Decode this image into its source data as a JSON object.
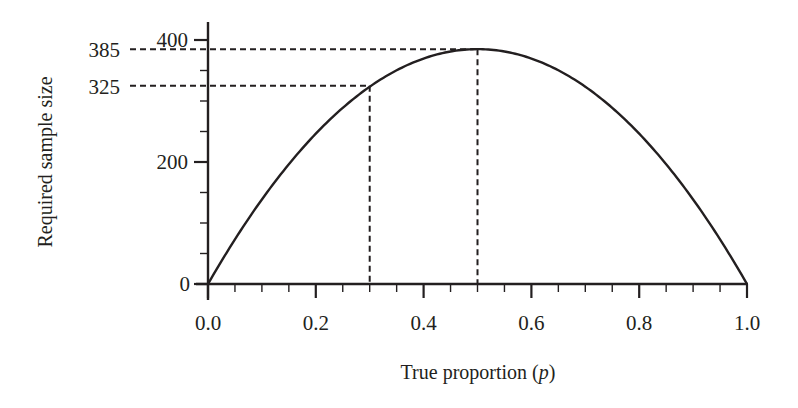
{
  "chart_data": {
    "type": "line",
    "title": "",
    "xlabel": "True proportion (p)",
    "xlabel_prefix": "True proportion (",
    "xlabel_var": "p",
    "xlabel_suffix": ")",
    "ylabel": "Required sample size",
    "xlim": [
      0.0,
      1.0
    ],
    "ylim": [
      0,
      400
    ],
    "x_ticks": [
      "0.0",
      "0.2",
      "0.4",
      "0.6",
      "0.8",
      "1.0"
    ],
    "x_tick_values": [
      0.0,
      0.2,
      0.4,
      0.6,
      0.8,
      1.0
    ],
    "x_minor_step": 0.05,
    "y_ticks": [
      "0",
      "200",
      "400"
    ],
    "y_tick_values": [
      0,
      200,
      400
    ],
    "y_minor_step": 50,
    "grid": false,
    "legend": null,
    "series": [
      {
        "name": "Required sample size",
        "formula": "n = 1540 * p * (1 - p)",
        "x": [
          0.0,
          0.1,
          0.2,
          0.3,
          0.4,
          0.5,
          0.6,
          0.7,
          0.8,
          0.9,
          1.0
        ],
        "values": [
          0,
          139,
          246,
          325,
          370,
          385,
          370,
          325,
          246,
          139,
          0
        ]
      }
    ],
    "annotations": [
      {
        "label": "385",
        "x": 0.5,
        "y": 385,
        "style": "dashed reference lines"
      },
      {
        "label": "325",
        "x": 0.3,
        "y": 325,
        "style": "dashed reference lines"
      }
    ]
  }
}
